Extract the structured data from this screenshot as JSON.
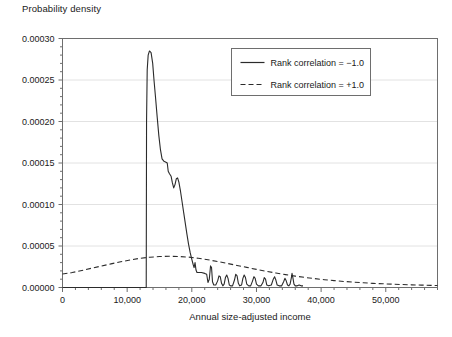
{
  "chart_data": {
    "type": "line",
    "title": "Probability density",
    "xlabel": "Annual size-adjusted income",
    "ylabel": "Probability density",
    "xlim": [
      0,
      58000
    ],
    "ylim": [
      0,
      0.0003
    ],
    "grid": true,
    "grid_axis": "y",
    "legend_position": "upper-right",
    "xticks": [
      0,
      10000,
      20000,
      30000,
      40000,
      50000
    ],
    "xticklabels": [
      "0",
      "10,000",
      "20,000",
      "30,000",
      "40,000",
      "50,000"
    ],
    "xminor_step": 2000,
    "yticks": [
      0.0,
      5e-05,
      0.0001,
      0.00015,
      0.0002,
      0.00025,
      0.0003
    ],
    "yticklabels": [
      "0.00000",
      "0.00005",
      "0.00010",
      "0.00015",
      "0.00020",
      "0.00025",
      "0.00030"
    ],
    "yminor_step": 1e-05,
    "series": [
      {
        "name": "Rank correlation = −1.0",
        "style": "solid",
        "color": "#2b2b2b",
        "points": [
          [
            0,
            0.0
          ],
          [
            12950,
            0.0
          ],
          [
            13000,
            0.0002
          ],
          [
            13100,
            0.000262
          ],
          [
            13250,
            0.00028
          ],
          [
            13450,
            0.000285
          ],
          [
            13700,
            0.000283
          ],
          [
            13950,
            0.00027
          ],
          [
            14150,
            0.00025
          ],
          [
            14400,
            0.000228
          ],
          [
            14650,
            0.000205
          ],
          [
            14900,
            0.000183
          ],
          [
            15150,
            0.000166
          ],
          [
            15400,
            0.000155
          ],
          [
            15700,
            0.000152
          ],
          [
            16000,
            0.000151
          ],
          [
            16200,
            0.00015
          ],
          [
            16350,
            0.00014
          ],
          [
            16550,
            0.000137
          ],
          [
            16800,
            0.000134
          ],
          [
            17000,
            0.000126
          ],
          [
            17200,
            0.00012
          ],
          [
            17400,
            0.000124
          ],
          [
            17600,
            0.000131
          ],
          [
            17800,
            0.000132
          ],
          [
            18000,
            0.000127
          ],
          [
            18250,
            0.000116
          ],
          [
            18500,
            0.000103
          ],
          [
            18750,
            9e-05
          ],
          [
            19000,
            7.7e-05
          ],
          [
            19250,
            6.4e-05
          ],
          [
            19500,
            5.2e-05
          ],
          [
            19750,
            4.2e-05
          ],
          [
            20000,
            3.4e-05
          ],
          [
            20200,
            2.8e-05
          ],
          [
            20350,
            2.4e-05
          ],
          [
            20500,
            3e-05
          ],
          [
            20650,
            2.1e-05
          ],
          [
            20800,
            1.8e-05
          ],
          [
            21000,
            1.8e-05
          ],
          [
            21500,
            1.8e-05
          ],
          [
            22000,
            1.7e-05
          ],
          [
            22300,
            1.6e-05
          ],
          [
            22500,
            6e-06
          ],
          [
            22700,
            1e-05
          ],
          [
            22900,
            2.6e-05
          ],
          [
            23050,
            2.4e-05
          ],
          [
            23200,
            7e-06
          ],
          [
            23400,
            3e-06
          ],
          [
            23700,
            3e-06
          ],
          [
            24000,
            8e-06
          ],
          [
            24200,
            1.4e-05
          ],
          [
            24400,
            1.3e-05
          ],
          [
            24600,
            5e-06
          ],
          [
            24800,
            2e-06
          ],
          [
            25000,
            4e-06
          ],
          [
            25200,
            1.2e-05
          ],
          [
            25400,
            1.5e-05
          ],
          [
            25600,
            1.1e-05
          ],
          [
            25800,
            3e-06
          ],
          [
            26000,
            2e-06
          ],
          [
            26300,
            2e-06
          ],
          [
            26600,
            9e-06
          ],
          [
            26800,
            1.6e-05
          ],
          [
            27000,
            1.4e-05
          ],
          [
            27200,
            5e-06
          ],
          [
            27400,
            2e-06
          ],
          [
            27700,
            3e-06
          ],
          [
            27900,
            1.1e-05
          ],
          [
            28100,
            1.5e-05
          ],
          [
            28300,
            1.2e-05
          ],
          [
            28500,
            4e-06
          ],
          [
            28800,
            2e-06
          ],
          [
            29100,
            2e-06
          ],
          [
            29400,
            8e-06
          ],
          [
            29600,
            1.3e-05
          ],
          [
            29800,
            1.1e-05
          ],
          [
            30000,
            4e-06
          ],
          [
            30300,
            2e-06
          ],
          [
            30700,
            2e-06
          ],
          [
            31000,
            6e-06
          ],
          [
            31200,
            1.2e-05
          ],
          [
            31400,
            1e-05
          ],
          [
            31600,
            3e-06
          ],
          [
            31900,
            2e-06
          ],
          [
            32300,
            3e-06
          ],
          [
            32600,
            1e-05
          ],
          [
            32800,
            1.3e-05
          ],
          [
            33000,
            9e-06
          ],
          [
            33200,
            3e-06
          ],
          [
            33500,
            2e-06
          ],
          [
            33900,
            2e-06
          ],
          [
            34200,
            7e-06
          ],
          [
            34400,
            1.1e-05
          ],
          [
            34600,
            8e-06
          ],
          [
            34800,
            3e-06
          ],
          [
            35000,
            2e-06
          ],
          [
            35200,
            4e-06
          ],
          [
            35400,
            1.2e-05
          ],
          [
            35500,
            1.7e-05
          ],
          [
            35650,
            1.1e-05
          ],
          [
            35800,
            4e-06
          ],
          [
            36000,
            2e-06
          ],
          [
            36300,
            2e-06
          ],
          [
            36600,
            3e-06
          ],
          [
            36900,
            2e-06
          ],
          [
            37200,
            2e-06
          ]
        ]
      },
      {
        "name": "Rank correlation = +1.0",
        "style": "dashed",
        "color": "#2b2b2b",
        "points": [
          [
            0,
            1.62e-05
          ],
          [
            1500,
            1.8e-05
          ],
          [
            3000,
            2.05e-05
          ],
          [
            4500,
            2.32e-05
          ],
          [
            6000,
            2.58e-05
          ],
          [
            7500,
            2.85e-05
          ],
          [
            9000,
            3.1e-05
          ],
          [
            10500,
            3.32e-05
          ],
          [
            12000,
            3.52e-05
          ],
          [
            13500,
            3.65e-05
          ],
          [
            15000,
            3.73e-05
          ],
          [
            16500,
            3.76e-05
          ],
          [
            18000,
            3.74e-05
          ],
          [
            19500,
            3.66e-05
          ],
          [
            21000,
            3.52e-05
          ],
          [
            22500,
            3.34e-05
          ],
          [
            24000,
            3.13e-05
          ],
          [
            25500,
            2.9e-05
          ],
          [
            27000,
            2.66e-05
          ],
          [
            28500,
            2.42e-05
          ],
          [
            30000,
            2.18e-05
          ],
          [
            31500,
            1.96e-05
          ],
          [
            33000,
            1.75e-05
          ],
          [
            34500,
            1.55e-05
          ],
          [
            36000,
            1.37e-05
          ],
          [
            37500,
            1.21e-05
          ],
          [
            39000,
            1.07e-05
          ],
          [
            40500,
            9.4e-06
          ],
          [
            42000,
            8.3e-06
          ],
          [
            43500,
            7.3e-06
          ],
          [
            45000,
            6.4e-06
          ],
          [
            46500,
            5.7e-06
          ],
          [
            48000,
            5e-06
          ],
          [
            49500,
            4.5e-06
          ],
          [
            51000,
            4e-06
          ],
          [
            52500,
            3.6e-06
          ],
          [
            54000,
            3.2e-06
          ],
          [
            55500,
            2.9e-06
          ],
          [
            57000,
            2.6e-06
          ],
          [
            58000,
            2.4e-06
          ]
        ]
      }
    ]
  },
  "legend": {
    "entries": [
      {
        "label": "Rank correlation = −1.0",
        "style": "solid"
      },
      {
        "label": "Rank correlation = +1.0",
        "style": "dashed"
      }
    ]
  },
  "colors": {
    "background": "#ffffff",
    "frame": "#6e6e6e",
    "gridline": "#e2e2e2",
    "line": "#2b2b2b",
    "text": "#1a1a1a"
  }
}
